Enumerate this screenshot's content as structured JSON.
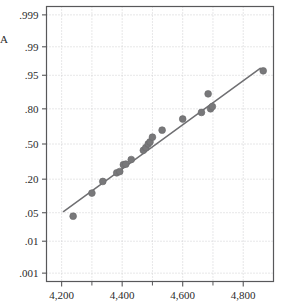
{
  "figure": {
    "width": 291,
    "height": 308,
    "background": "#ffffff",
    "axis_stub_label": "A"
  },
  "style": {
    "marker_color": "#78787a",
    "marker_edge_color": "#6a6a6c",
    "line_color": "#6f6f72",
    "frame_color": "#58585a",
    "grid_color": "#c9c9cc",
    "tick_color": "#58585a",
    "text_color": "#2b2b2b"
  },
  "chart_data": {
    "type": "scatter",
    "title": "",
    "subtitle": "",
    "xlabel": "",
    "ylabel": "",
    "grid": true,
    "legend": "none",
    "xlim": [
      4150,
      4900
    ],
    "ylim_probability": [
      0.0005,
      0.9995
    ],
    "y_scale": "normal probability (probit)",
    "x_tick_values": [
      4200,
      4400,
      4600,
      4800
    ],
    "x_tick_labels": [
      "4,200",
      "4,400",
      "4,600",
      "4,800"
    ],
    "x_minor_gridlines": [
      4300,
      4500,
      4700
    ],
    "y_tick_values": [
      0.999,
      0.99,
      0.95,
      0.8,
      0.5,
      0.2,
      0.05,
      0.01,
      0.001
    ],
    "y_tick_labels": [
      ".999",
      ".99",
      ".95",
      ".80",
      ".50",
      ".20",
      ".05",
      ".01",
      ".001"
    ],
    "series": [
      {
        "name": "observations",
        "marker": "filled-circle",
        "x": [
          4238,
          4300,
          4336,
          4382,
          4392,
          4404,
          4412,
          4430,
          4470,
          4478,
          4486,
          4492,
          4500,
          4532,
          4600,
          4662,
          4684,
          4692,
          4698,
          4866
        ],
        "probability": [
          0.042,
          0.12,
          0.185,
          0.245,
          0.255,
          0.31,
          0.315,
          0.355,
          0.44,
          0.465,
          0.5,
          0.52,
          0.565,
          0.63,
          0.725,
          0.775,
          0.885,
          0.8,
          0.815,
          0.96
        ]
      }
    ],
    "fit_line": {
      "name": "reference-line",
      "x": [
        4206,
        4856
      ],
      "probability": [
        0.053,
        0.965
      ]
    }
  }
}
